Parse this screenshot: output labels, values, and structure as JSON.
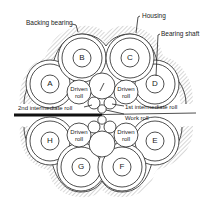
{
  "diagram": {
    "type": "cross-section",
    "labels": {
      "housing": "Housing",
      "backing_bearing": "Backing bearing",
      "bearing_shaft": "Bearing shaft",
      "second_intermediate_roll": "2nd intermediate roll",
      "first_intermediate_roll": "1st intermediate roll",
      "work_roll": "Work roll"
    },
    "driven_roll": {
      "line1": "Driven",
      "line2": "roll"
    },
    "backing_bearings": [
      {
        "id": "A",
        "label": "A"
      },
      {
        "id": "B",
        "label": "B"
      },
      {
        "id": "C",
        "label": "C"
      },
      {
        "id": "D",
        "label": "D"
      },
      {
        "id": "E",
        "label": "E"
      },
      {
        "id": "F",
        "label": "F"
      },
      {
        "id": "G",
        "label": "G"
      },
      {
        "id": "H",
        "label": "H"
      }
    ],
    "colors": {
      "line": "#222222",
      "background": "#ffffff",
      "hatch": "#888888",
      "strip": "#111111"
    }
  }
}
